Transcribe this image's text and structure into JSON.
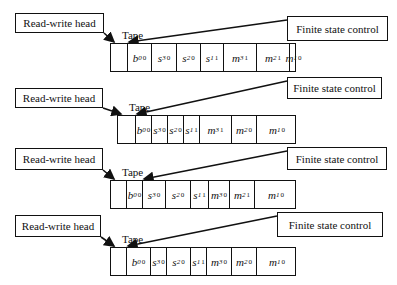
{
  "labels": {
    "read_write_head": "Read-write head",
    "tape": "Tape",
    "finite_state_control": "Finite state control"
  },
  "panels": [
    {
      "top": 4,
      "rw_box": {
        "x": 15,
        "y": 9,
        "w": 89,
        "h": 20
      },
      "fsc_box": {
        "x": 287,
        "y": 12,
        "w": 101,
        "h": 25
      },
      "tape": {
        "x": 110,
        "y": 39,
        "w": 186
      },
      "head_index": 1,
      "cells": [
        {
          "w": 17,
          "sym": "",
          "sub": "",
          "sup": ""
        },
        {
          "w": 24,
          "sym": "b",
          "sub": "0",
          "sup": "0"
        },
        {
          "w": 25,
          "sym": "s",
          "sub": "3",
          "sup": "0"
        },
        {
          "w": 24,
          "sym": "s",
          "sub": "2",
          "sup": "0"
        },
        {
          "w": 23,
          "sym": "s",
          "sub": "1",
          "sup": "1"
        },
        {
          "w": 33,
          "sym": "m",
          "sub": "3",
          "sup": "1"
        },
        {
          "w": 33,
          "sym": "m",
          "sub": "2",
          "sup": "1"
        },
        {
          "w": 7,
          "sym": "m",
          "sub": "1",
          "sup": "0"
        }
      ]
    },
    {
      "top": 75,
      "rw_box": {
        "x": 15,
        "y": 13,
        "w": 88,
        "h": 20
      },
      "fsc_box": {
        "x": 287,
        "y": 2,
        "w": 95,
        "h": 22
      },
      "tape": {
        "x": 117,
        "y": 40,
        "w": 179
      },
      "head_index": 1,
      "cells": [
        {
          "w": 18,
          "sym": "",
          "sub": "",
          "sup": ""
        },
        {
          "w": 16,
          "sym": "b",
          "sub": "0",
          "sup": "0"
        },
        {
          "w": 16,
          "sym": "s",
          "sub": "3",
          "sup": "0"
        },
        {
          "w": 16,
          "sym": "s",
          "sub": "2",
          "sup": "0"
        },
        {
          "w": 16,
          "sym": "s",
          "sub": "1",
          "sup": "1"
        },
        {
          "w": 32,
          "sym": "m",
          "sub": "3",
          "sup": "1"
        },
        {
          "w": 25,
          "sym": "m",
          "sub": "2",
          "sup": "0"
        },
        {
          "w": 40,
          "sym": "m",
          "sub": "1",
          "sup": "0"
        }
      ]
    },
    {
      "top": 140,
      "rw_box": {
        "x": 15,
        "y": 8,
        "w": 88,
        "h": 22
      },
      "fsc_box": {
        "x": 287,
        "y": 7,
        "w": 100,
        "h": 23
      },
      "tape": {
        "x": 110,
        "y": 40,
        "w": 186
      },
      "head_index": 2,
      "cells": [
        {
          "w": 16,
          "sym": "",
          "sub": "",
          "sup": ""
        },
        {
          "w": 16,
          "sym": "b",
          "sub": "0",
          "sup": "0"
        },
        {
          "w": 23,
          "sym": "s",
          "sub": "3",
          "sup": "0"
        },
        {
          "w": 25,
          "sym": "s",
          "sub": "2",
          "sup": "0"
        },
        {
          "w": 18,
          "sym": "s",
          "sub": "1",
          "sup": "1"
        },
        {
          "w": 21,
          "sym": "m",
          "sub": "3",
          "sup": "0"
        },
        {
          "w": 25,
          "sym": "m",
          "sub": "2",
          "sup": "1"
        },
        {
          "w": 42,
          "sym": "m",
          "sub": "1",
          "sup": "0"
        }
      ]
    },
    {
      "top": 208,
      "rw_box": {
        "x": 15,
        "y": 7,
        "w": 86,
        "h": 22
      },
      "fsc_box": {
        "x": 277,
        "y": 4,
        "w": 106,
        "h": 25
      },
      "tape": {
        "x": 110,
        "y": 39,
        "w": 186
      },
      "head_index": 1,
      "cells": [
        {
          "w": 16,
          "sym": "",
          "sub": "",
          "sup": ""
        },
        {
          "w": 24,
          "sym": "b",
          "sub": "0",
          "sup": "0"
        },
        {
          "w": 16,
          "sym": "s",
          "sub": "3",
          "sup": "0"
        },
        {
          "w": 24,
          "sym": "s",
          "sub": "2",
          "sup": "0"
        },
        {
          "w": 16,
          "sym": "s",
          "sub": "1",
          "sup": "1"
        },
        {
          "w": 25,
          "sym": "m",
          "sub": "3",
          "sup": "0"
        },
        {
          "w": 25,
          "sym": "m",
          "sub": "2",
          "sup": "0"
        },
        {
          "w": 40,
          "sym": "m",
          "sub": "1",
          "sup": "0"
        }
      ]
    }
  ]
}
